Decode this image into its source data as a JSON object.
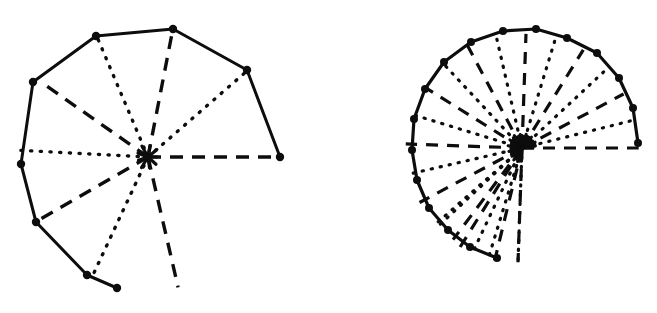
{
  "figure": {
    "background_color": "#ffffff",
    "ink_color": "#0d0d0d",
    "width": 657,
    "height": 313,
    "caption": "",
    "panels": [
      {
        "name": "left-spiral",
        "label": "",
        "description": "Coarse spiral of Theodorus with 9 radial spokes alternating dashed and dotted",
        "center": [
          148,
          157
        ],
        "start_angle_deg": 0,
        "spoke_count": 9,
        "hull_closed": false,
        "hull_style": "solid",
        "vertex_marker": "filled-circle",
        "vertex_radius": 4.2,
        "hull_stroke_width": 3.0,
        "spoke_stroke_width": 3.4,
        "dash_pattern": "13,9",
        "dot_pattern": "1.2,8.5",
        "radii": [
          132,
          131,
          131,
          132,
          131,
          130,
          131,
          132,
          133,
          133
        ],
        "angles_deg": [
          0,
          41,
          79,
          113,
          145,
          177,
          210,
          245,
          283,
          318
        ],
        "vertices": [
          [
            280,
            157
          ],
          [
            247,
            70
          ],
          [
            173,
            29
          ],
          [
            96,
            36
          ],
          [
            33,
            82
          ],
          [
            21,
            164
          ],
          [
            36,
            222
          ],
          [
            87,
            275
          ],
          [
            117,
            288
          ]
        ],
        "spoke_styles": [
          "dashed",
          "dotted",
          "dashed",
          "dotted",
          "dashed",
          "dotted",
          "dashed",
          "dotted",
          "dashed",
          "dotted"
        ]
      },
      {
        "name": "right-spiral",
        "label": "",
        "description": "Fine spiral of Theodorus with 24 radial spokes alternating dashed and dotted, dense convergence blob at centre",
        "center": [
          522,
          148
        ],
        "start_angle_deg": 0,
        "spoke_count": 24,
        "hull_closed": false,
        "hull_style": "solid",
        "vertex_marker": "filled-circle",
        "vertex_radius": 4.0,
        "hull_stroke_width": 3.2,
        "spoke_stroke_width": 3.2,
        "dash_pattern": "12,9",
        "dot_pattern": "1.2,8.0",
        "radii": [
          116,
          116,
          115,
          115,
          116,
          116,
          115,
          116,
          116,
          115,
          116,
          116,
          115,
          116,
          116,
          115,
          116,
          116,
          115,
          116,
          116,
          115,
          116,
          116
        ],
        "angles_deg": [
          0,
          14,
          28,
          43,
          58,
          73,
          88,
          103,
          118,
          133,
          148,
          163,
          178,
          193,
          208,
          223,
          238,
          253,
          268
        ],
        "vertices": [
          [
            638,
            143
          ],
          [
            633,
            108
          ],
          [
            619,
            78
          ],
          [
            597,
            53
          ],
          [
            567,
            38
          ],
          [
            536,
            29
          ],
          [
            503,
            31
          ],
          [
            471,
            42
          ],
          [
            444,
            62
          ],
          [
            425,
            89
          ],
          [
            414,
            119
          ],
          [
            412,
            150
          ],
          [
            417,
            180
          ],
          [
            429,
            208
          ],
          [
            448,
            230
          ],
          [
            470,
            247
          ],
          [
            497,
            258
          ]
        ],
        "spoke_styles": [
          "dashed",
          "dotted",
          "dashed",
          "dotted",
          "dashed",
          "dotted",
          "dashed",
          "dotted",
          "dashed",
          "dotted",
          "dashed",
          "dotted",
          "dashed",
          "dotted",
          "dashed",
          "dotted",
          "dashed",
          "dotted",
          "dashed",
          "dotted",
          "dashed",
          "dotted",
          "dashed",
          "dotted"
        ]
      }
    ]
  }
}
